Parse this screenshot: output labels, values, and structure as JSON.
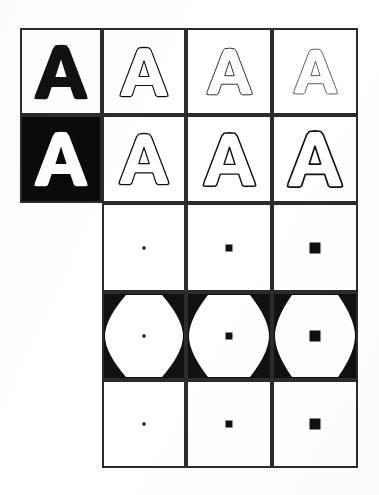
{
  "figure": {
    "background_color": "#ffffff",
    "ink_color": "#111111",
    "border_color": "#2b2b2b",
    "grid": {
      "left": 20,
      "top": 28,
      "right": 358,
      "bottom": 468,
      "column_edges": [
        20,
        102,
        186,
        272,
        358
      ],
      "row_edges": [
        28,
        115,
        203,
        292,
        380,
        468
      ],
      "columns": 4,
      "rows": 5
    }
  },
  "cells": [
    {
      "id": "r1c1",
      "row": 1,
      "col": 1,
      "name": "original-letter-a-solid",
      "kind": "glyph",
      "glyph": "A",
      "render": "solid",
      "fill": "#111111",
      "background": "#ffffff",
      "scale": 1.0
    },
    {
      "id": "r1c2",
      "row": 1,
      "col": 2,
      "name": "letter-a-outline-thin-1",
      "kind": "glyph",
      "glyph": "A",
      "render": "outline",
      "fill": "#ffffff",
      "stroke": "#111111",
      "stroke_width": 2.0,
      "background": "#ffffff",
      "scale": 0.9
    },
    {
      "id": "r1c3",
      "row": 1,
      "col": 3,
      "name": "letter-a-outline-thin-2",
      "kind": "glyph",
      "glyph": "A",
      "render": "outline",
      "fill": "#ffffff",
      "stroke": "#111111",
      "stroke_width": 1.6,
      "background": "#ffffff",
      "scale": 0.86
    },
    {
      "id": "r1c4",
      "row": 1,
      "col": 4,
      "name": "letter-a-outline-thin-3",
      "kind": "glyph",
      "glyph": "A",
      "render": "outline",
      "fill": "#ffffff",
      "stroke": "#111111",
      "stroke_width": 1.3,
      "background": "#ffffff",
      "scale": 0.82
    },
    {
      "id": "r2c1",
      "row": 2,
      "col": 1,
      "name": "inverted-letter-a-solid",
      "kind": "glyph",
      "glyph": "A",
      "render": "solid",
      "fill": "#ffffff",
      "background": "#0a0a0a",
      "scale": 1.0
    },
    {
      "id": "r2c2",
      "row": 2,
      "col": 2,
      "name": "letter-a-outline-dilated-1",
      "kind": "glyph",
      "glyph": "A",
      "render": "outline",
      "fill": "#ffffff",
      "stroke": "#111111",
      "stroke_width": 2.2,
      "background": "#ffffff",
      "scale": 0.94
    },
    {
      "id": "r2c3",
      "row": 2,
      "col": 3,
      "name": "letter-a-outline-dilated-2",
      "kind": "glyph",
      "glyph": "A",
      "render": "outline",
      "fill": "#ffffff",
      "stroke": "#111111",
      "stroke_width": 2.4,
      "background": "#ffffff",
      "scale": 0.99
    },
    {
      "id": "r2c4",
      "row": 2,
      "col": 4,
      "name": "letter-a-outline-dilated-3",
      "kind": "glyph",
      "glyph": "A",
      "render": "outline",
      "fill": "#ffffff",
      "stroke": "#111111",
      "stroke_width": 2.6,
      "background": "#ffffff",
      "scale": 1.04
    },
    {
      "id": "r3c2",
      "row": 3,
      "col": 2,
      "name": "structuring-element-small",
      "kind": "dot",
      "dot_size": 3,
      "fill": "#111111",
      "background": "#ffffff"
    },
    {
      "id": "r3c3",
      "row": 3,
      "col": 3,
      "name": "structuring-element-medium",
      "kind": "dot",
      "dot_size": 7,
      "fill": "#111111",
      "background": "#ffffff"
    },
    {
      "id": "r3c4",
      "row": 3,
      "col": 4,
      "name": "structuring-element-large",
      "kind": "dot",
      "dot_size": 11,
      "fill": "#111111",
      "background": "#ffffff"
    },
    {
      "id": "r4c2",
      "row": 4,
      "col": 2,
      "name": "eroded-frame-small-with-structuring-element",
      "kind": "thick-frame",
      "dot_size": 3,
      "corner_cut": 22,
      "fill": "#111111",
      "background": "#ffffff"
    },
    {
      "id": "r4c3",
      "row": 4,
      "col": 3,
      "name": "eroded-frame-medium-with-structuring-element",
      "kind": "thick-frame",
      "dot_size": 7,
      "corner_cut": 20,
      "fill": "#111111",
      "background": "#ffffff"
    },
    {
      "id": "r4c4",
      "row": 4,
      "col": 4,
      "name": "eroded-frame-large-with-structuring-element",
      "kind": "thick-frame",
      "dot_size": 11,
      "corner_cut": 18,
      "fill": "#111111",
      "background": "#ffffff"
    },
    {
      "id": "r5c2",
      "row": 5,
      "col": 2,
      "name": "structuring-element-small-repeat",
      "kind": "dot",
      "dot_size": 3,
      "fill": "#111111",
      "background": "#ffffff"
    },
    {
      "id": "r5c3",
      "row": 5,
      "col": 3,
      "name": "structuring-element-medium-repeat",
      "kind": "dot",
      "dot_size": 7,
      "fill": "#111111",
      "background": "#ffffff"
    },
    {
      "id": "r5c4",
      "row": 5,
      "col": 4,
      "name": "structuring-element-large-repeat",
      "kind": "dot",
      "dot_size": 11,
      "fill": "#111111",
      "background": "#ffffff"
    }
  ]
}
